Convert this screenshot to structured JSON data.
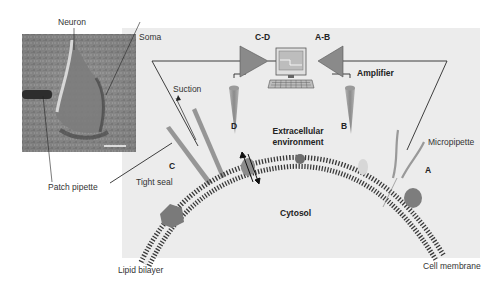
{
  "figure": {
    "colors": {
      "panel_bg": "#ececec",
      "membrane": "#3a3a3a",
      "pipette_gray": "#8f8f8f",
      "amplifier_gray": "#8a8a8a",
      "protein_gray": "#7d7d7d",
      "photo_dark": "#4a4a4a",
      "wire": "#2a2a2a"
    },
    "photo": {
      "label_neuron": "Neuron",
      "label_soma": "Soma",
      "label_patch_pipette": "Patch pipette"
    },
    "labels": {
      "amplifier_left": "C-D",
      "amplifier_right": "A-B",
      "amplifier": "Amplifier",
      "suction": "Suction",
      "pipette_d": "D",
      "pipette_b": "B",
      "pipette_c": "C",
      "pipette_a": "A",
      "extracellular_line1": "Extracellular",
      "extracellular_line2": "environment",
      "micropipette": "Micropipette",
      "tight_seal": "Tight seal",
      "cytosol": "Cytosol",
      "lipid_bilayer": "Lipid bilayer",
      "cell_membrane": "Cell membrane"
    },
    "icons": [
      "computer-icon",
      "amplifier-triangle-icon",
      "double-arrow-icon"
    ]
  }
}
